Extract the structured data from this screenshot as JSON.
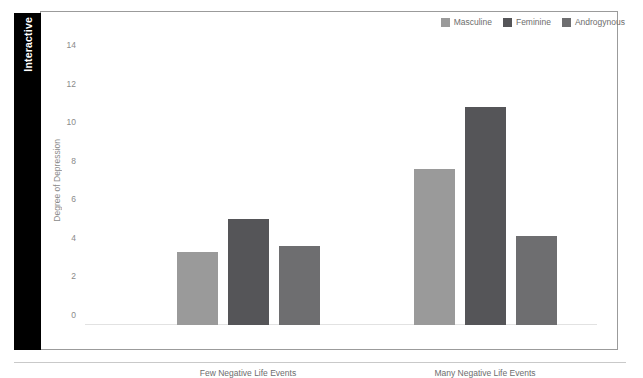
{
  "sidebar": {
    "tab_label": "Interactive"
  },
  "chart_data": {
    "type": "bar",
    "title": "",
    "subtitle": "",
    "xlabel": "",
    "ylabel": "Degree of Depression",
    "ylim": [
      0,
      15
    ],
    "yticks": [
      0,
      2,
      4,
      6,
      8,
      10,
      12,
      14
    ],
    "ytick_labels": [
      "0",
      "2",
      "4",
      "6",
      "8",
      "10",
      "12",
      "14"
    ],
    "grid": false,
    "legend_position": "top-right",
    "categories": [
      "Few Negative Life Events",
      "Many Negative Life Events"
    ],
    "series": [
      {
        "name": "Masculine",
        "color": "#9a9a9a",
        "values": [
          3.8,
          8.1
        ]
      },
      {
        "name": "Feminine",
        "color": "#555558",
        "values": [
          5.5,
          11.3
        ]
      },
      {
        "name": "Androgynous",
        "color": "#6e6e70",
        "values": [
          4.1,
          4.6
        ]
      }
    ]
  }
}
